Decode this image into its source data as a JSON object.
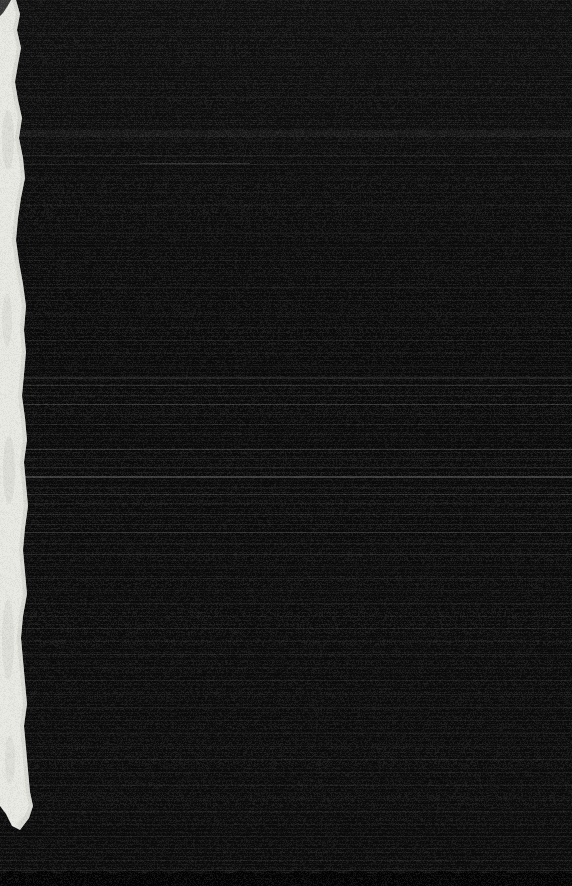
{
  "colors": {
    "page_background": "#000000",
    "cover_top": "#0e0e0e",
    "cover_mid": "#0a0a0a",
    "cover_bottom": "#0b0b0b",
    "bottom_band": "#040404",
    "bottom_band_edge": "#1d1d1d",
    "page_edge_paper": "#e9e9e4",
    "page_edge_shade": "#c7c7c0",
    "page_edge_mottle": "#c4c4bd",
    "page_edge_corner_notch": "#242424"
  },
  "texture": {
    "noise": {
      "light_alpha": 0.06,
      "dark_alpha": 0.05,
      "row_variation": 0.035,
      "seed": 42
    },
    "scanlines": [
      {
        "y": 6,
        "c": "#1c1c1c",
        "o": 0.5
      },
      {
        "y": 14,
        "c": "#161616",
        "o": 0.5
      },
      {
        "y": 22,
        "c": "#1a1a1a",
        "o": 0.5
      },
      {
        "y": 34,
        "c": "#232323",
        "o": 0.6
      },
      {
        "y": 47,
        "c": "#181818",
        "o": 0.5
      },
      {
        "y": 58,
        "c": "#202020",
        "o": 0.5
      },
      {
        "y": 70,
        "c": "#191919",
        "o": 0.5
      },
      {
        "y": 83,
        "c": "#1d1d1d",
        "o": 0.5
      },
      {
        "y": 97,
        "c": "#252525",
        "o": 0.6
      },
      {
        "y": 110,
        "c": "#181818",
        "o": 0.5
      },
      {
        "y": 122,
        "c": "#1b1b1b",
        "o": 0.5
      },
      {
        "y": 130,
        "c": "#272727",
        "o": 0.4,
        "h": 7
      },
      {
        "y": 141,
        "c": "#1e1e1e",
        "o": 0.5
      },
      {
        "y": 155,
        "c": "#2a2a2a",
        "o": 0.6
      },
      {
        "y": 163,
        "c": "#4a4a4a",
        "o": 0.55,
        "x": 140,
        "w": 110
      },
      {
        "y": 164,
        "c": "#2e2e2e",
        "o": 0.5
      },
      {
        "y": 178,
        "c": "#191919",
        "o": 0.5
      },
      {
        "y": 192,
        "c": "#1f1f1f",
        "o": 0.5
      },
      {
        "y": 205,
        "c": "#232323",
        "o": 0.55
      },
      {
        "y": 220,
        "c": "#1a1a1a",
        "o": 0.5
      },
      {
        "y": 233,
        "c": "#272727",
        "o": 0.5
      },
      {
        "y": 247,
        "c": "#1c1c1c",
        "o": 0.5
      },
      {
        "y": 260,
        "c": "#222222",
        "o": 0.5
      },
      {
        "y": 274,
        "c": "#1e1e1e",
        "o": 0.5
      },
      {
        "y": 287,
        "c": "#292929",
        "o": 0.55
      },
      {
        "y": 300,
        "c": "#1d1d1d",
        "o": 0.5
      },
      {
        "y": 314,
        "c": "#242424",
        "o": 0.5
      },
      {
        "y": 327,
        "c": "#1f1f1f",
        "o": 0.5
      },
      {
        "y": 340,
        "c": "#2b2b2b",
        "o": 0.55
      },
      {
        "y": 353,
        "c": "#202020",
        "o": 0.5
      },
      {
        "y": 366,
        "c": "#262626",
        "o": 0.5
      },
      {
        "y": 377,
        "c": "#343434",
        "o": 0.6,
        "h": 2
      },
      {
        "y": 385,
        "c": "#3e3e3e",
        "o": 0.65
      },
      {
        "y": 395,
        "c": "#2c2c2c",
        "o": 0.55
      },
      {
        "y": 404,
        "c": "#454545",
        "o": 0.7
      },
      {
        "y": 414,
        "c": "#282828",
        "o": 0.5
      },
      {
        "y": 424,
        "c": "#303030",
        "o": 0.55
      },
      {
        "y": 434,
        "c": "#2a2a2a",
        "o": 0.5
      },
      {
        "y": 449,
        "c": "#464646",
        "o": 0.7
      },
      {
        "y": 458,
        "c": "#2e2e2e",
        "o": 0.55
      },
      {
        "y": 467,
        "c": "#343434",
        "o": 0.6
      },
      {
        "y": 476,
        "c": "#4c4c4c",
        "o": 0.75,
        "h": 2
      },
      {
        "y": 487,
        "c": "#2c2c2c",
        "o": 0.5
      },
      {
        "y": 494,
        "c": "#3c3c3c",
        "o": 0.65
      },
      {
        "y": 503,
        "c": "#2e2e2e",
        "o": 0.5
      },
      {
        "y": 514,
        "c": "#343434",
        "o": 0.55
      },
      {
        "y": 524,
        "c": "#2a2a2a",
        "o": 0.5
      },
      {
        "y": 532,
        "c": "#424242",
        "o": 0.65
      },
      {
        "y": 543,
        "c": "#2c2c2c",
        "o": 0.5
      },
      {
        "y": 554,
        "c": "#383838",
        "o": 0.6
      },
      {
        "y": 566,
        "c": "#262626",
        "o": 0.5
      },
      {
        "y": 578,
        "c": "#2e2e2e",
        "o": 0.5
      },
      {
        "y": 590,
        "c": "#222222",
        "o": 0.5
      },
      {
        "y": 603,
        "c": "#282828",
        "o": 0.5
      },
      {
        "y": 616,
        "c": "#202020",
        "o": 0.5
      },
      {
        "y": 628,
        "c": "#2c2c2c",
        "o": 0.55
      },
      {
        "y": 641,
        "c": "#242424",
        "o": 0.5
      },
      {
        "y": 654,
        "c": "#2e2e2e",
        "o": 0.55
      },
      {
        "y": 667,
        "c": "#212121",
        "o": 0.5
      },
      {
        "y": 680,
        "c": "#292929",
        "o": 0.5
      },
      {
        "y": 694,
        "c": "#232323",
        "o": 0.5
      },
      {
        "y": 707,
        "c": "#2b2b2b",
        "o": 0.55
      },
      {
        "y": 720,
        "c": "#1f1f1f",
        "o": 0.5
      },
      {
        "y": 733,
        "c": "#272727",
        "o": 0.5
      },
      {
        "y": 746,
        "c": "#212121",
        "o": 0.5
      },
      {
        "y": 759,
        "c": "#2d2d2d",
        "o": 0.55
      },
      {
        "y": 772,
        "c": "#232323",
        "o": 0.5
      },
      {
        "y": 785,
        "c": "#292929",
        "o": 0.5
      },
      {
        "y": 798,
        "c": "#1f1f1f",
        "o": 0.5
      },
      {
        "y": 811,
        "c": "#252525",
        "o": 0.5
      },
      {
        "y": 824,
        "c": "#1e1e1e",
        "o": 0.5
      },
      {
        "y": 836,
        "c": "#282828",
        "o": 0.5
      },
      {
        "y": 848,
        "c": "#202020",
        "o": 0.5
      },
      {
        "y": 860,
        "c": "#242424",
        "o": 0.5
      },
      {
        "y": 870,
        "c": "#2e2e2e",
        "o": 0.6
      }
    ]
  }
}
